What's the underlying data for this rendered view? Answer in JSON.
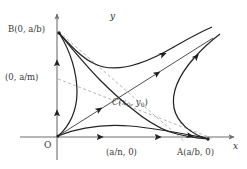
{
  "figure": {
    "kind": "phase-plane-diagram",
    "background_color": "#ffffff",
    "line_color": "#2b2b2b",
    "axis_color": "#6f6f6f",
    "dashed_color": "#9a9a9a",
    "label_color": "#3a3a3a",
    "width": 247,
    "height": 169
  },
  "axes": {
    "x_label": "x",
    "y_label": "y",
    "origin_label": "O",
    "x_axis_direction": "right",
    "y_axis_direction": "up"
  },
  "points": [
    {
      "id": "B",
      "label": "B(0, a/b)",
      "x": 0,
      "y": 1.0,
      "desc": "y-intercept equilibrium"
    },
    {
      "id": "Am",
      "label": "(0, a/m)",
      "x": 0,
      "y": 0.47,
      "desc": "y-axis nullcline intercept"
    },
    {
      "id": "C",
      "label": "C(x₀, y₀)",
      "x": 0.52,
      "y": 0.38,
      "desc": "interior equilibrium / saddle"
    },
    {
      "id": "An",
      "label": "(a/n, 0)",
      "x": 0.52,
      "y": 0,
      "desc": "x-axis nullcline intercept"
    },
    {
      "id": "A",
      "label": "A(a/b, 0)",
      "x": 1.0,
      "y": 0,
      "desc": "x-intercept equilibrium"
    }
  ],
  "curve_labels": {
    "C_base": "C(x",
    "C_sub1": "0",
    "C_mid": ", y",
    "C_sub2": "0",
    "C_close": ")"
  },
  "flow_arrows": [
    {
      "on": "y-axis",
      "direction": "up"
    },
    {
      "on": "y-axis",
      "direction": "up"
    },
    {
      "on": "x-axis",
      "direction": "right"
    },
    {
      "on": "x-axis",
      "direction": "right"
    },
    {
      "on": "separatrix",
      "direction": "up-right"
    },
    {
      "on": "separatrix",
      "direction": "up-right"
    },
    {
      "on": "upper-trajectory",
      "direction": "up-right"
    },
    {
      "on": "right-trajectory",
      "direction": "up-right"
    },
    {
      "on": "lower-trajectory",
      "direction": "right"
    }
  ],
  "nullclines": [
    {
      "style": "dashed",
      "from": "B",
      "to": "An",
      "desc": "first nullcline"
    },
    {
      "style": "dashed",
      "from": "Am",
      "to": "A",
      "desc": "second nullcline"
    }
  ]
}
